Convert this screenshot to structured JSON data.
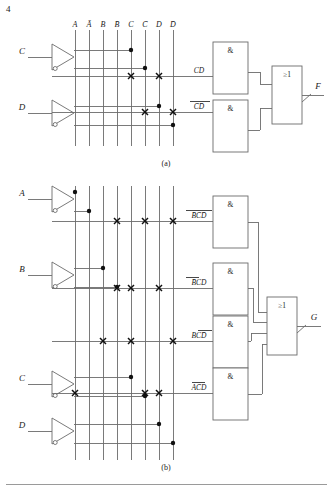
{
  "figure": {
    "type": "pla-logic-diagram",
    "caption_a": "(a)",
    "caption_b": "(b)",
    "corner_mark": "4"
  },
  "column_labels": [
    "A",
    "Ā",
    "B",
    "B̄",
    "C",
    "C̄",
    "D",
    "D̄"
  ],
  "gate_symbols": {
    "and": "&",
    "or": "≥1"
  },
  "diagram_a": {
    "inputs": [
      {
        "name": "C",
        "label": "C"
      },
      {
        "name": "D",
        "label": "D"
      }
    ],
    "product_terms": [
      {
        "label": "CD",
        "literals": [
          "C",
          "D"
        ],
        "columns": [
          5,
          7
        ]
      },
      {
        "label": "C̄D̄",
        "literals": [
          "C̄",
          "D̄"
        ],
        "columns": [
          6,
          8
        ]
      }
    ],
    "and_gates": [
      "&",
      "&"
    ],
    "or_gate": "≥1",
    "output": {
      "name": "F",
      "label": "F",
      "inverted": true
    }
  },
  "diagram_b": {
    "inputs": [
      {
        "name": "A",
        "label": "A"
      },
      {
        "name": "B",
        "label": "B"
      },
      {
        "name": "C",
        "label": "C"
      },
      {
        "name": "D",
        "label": "D"
      }
    ],
    "product_terms": [
      {
        "label": "B̄C̄D̄",
        "literals": [
          "B̄",
          "C̄",
          "D̄"
        ],
        "columns": [
          4,
          6,
          8
        ]
      },
      {
        "label": "B̄CD",
        "literals": [
          "B̄",
          "C",
          "D"
        ],
        "columns": [
          4,
          5,
          7
        ]
      },
      {
        "label": "BCD̄",
        "literals": [
          "B",
          "C",
          "D̄"
        ],
        "columns": [
          3,
          5,
          8
        ]
      },
      {
        "label": "AC̄D",
        "literals": [
          "A",
          "C̄",
          "D"
        ],
        "columns": [
          1,
          6,
          7
        ]
      }
    ],
    "and_gates": [
      "&",
      "&",
      "&",
      "&"
    ],
    "or_gate": "≥1",
    "output": {
      "name": "G",
      "label": "G",
      "inverted": true
    }
  },
  "colors": {
    "line": "#6b6b6b",
    "ink": "#1a1a1a",
    "rule": "#9a9a9a"
  }
}
